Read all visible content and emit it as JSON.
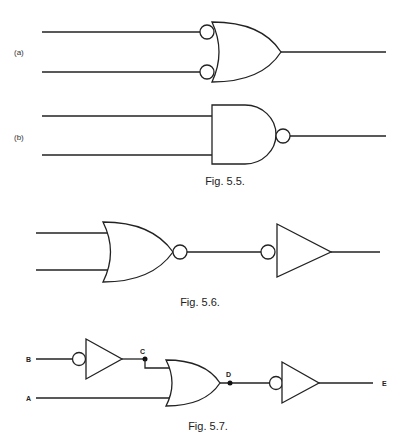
{
  "figures": [
    {
      "id": "fig-5-5",
      "caption": "Fig. 5.5.",
      "parts": [
        {
          "label": "(a)",
          "gate": "OR with inverted inputs"
        },
        {
          "label": "(b)",
          "gate": "NAND"
        }
      ]
    },
    {
      "id": "fig-5-6",
      "caption": "Fig. 5.6.",
      "gates": [
        "NOR",
        "Inverter (input bubble)"
      ]
    },
    {
      "id": "fig-5-7",
      "caption": "Fig. 5.7.",
      "signals": {
        "b": "B",
        "a": "A",
        "c": "C",
        "d": "D",
        "e": "E"
      },
      "gates": [
        "Inverter (input bubble) on B",
        "OR",
        "Inverter (input bubble)"
      ]
    }
  ]
}
